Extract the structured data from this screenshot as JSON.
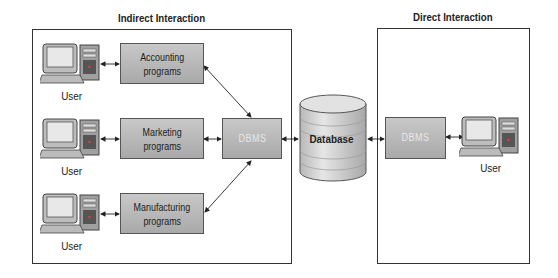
{
  "sections": {
    "indirect": {
      "title": "Indirect Interaction"
    },
    "direct": {
      "title": "Direct Interaction"
    }
  },
  "programs": [
    {
      "line1": "Accounting",
      "line2": "programs"
    },
    {
      "line1": "Marketing",
      "line2": "programs"
    },
    {
      "line1": "Manufacturing",
      "line2": "programs"
    }
  ],
  "users": [
    {
      "label": "User"
    },
    {
      "label": "User"
    },
    {
      "label": "User"
    },
    {
      "label": "User"
    }
  ],
  "dbms_indirect": {
    "label": "DBMS"
  },
  "dbms_direct": {
    "label": "DBMS"
  },
  "database": {
    "label": "Database"
  },
  "colors": {
    "box_fill_top": "#c8c8c8",
    "box_fill_bottom": "#a9a9a9",
    "border": "#333333",
    "dbms_text": "#e8e8e8"
  }
}
